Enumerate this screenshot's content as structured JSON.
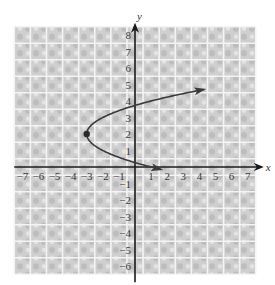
{
  "chart_data": {
    "type": "line",
    "title": "",
    "xlabel": "x",
    "ylabel": "y",
    "xlim": [
      -7.5,
      7.5
    ],
    "ylim": [
      -6.5,
      8.5
    ],
    "grid": true,
    "x_ticks": [
      -7,
      -6,
      -5,
      -4,
      -3,
      -2,
      -1,
      1,
      2,
      3,
      4,
      5,
      6,
      7
    ],
    "y_ticks": [
      -6,
      -5,
      -4,
      -3,
      -2,
      -1,
      1,
      2,
      3,
      4,
      5,
      6,
      7,
      8
    ],
    "x_tick_labels": [
      "−7",
      "−6",
      "−5",
      "−4",
      "−3",
      "−2",
      "−1",
      "1",
      "2",
      "3",
      "4",
      "5",
      "6",
      "7"
    ],
    "y_tick_labels": [
      "−6",
      "−5",
      "−4",
      "−3",
      "−2",
      "−1",
      "1",
      "2",
      "3",
      "4",
      "5",
      "6",
      "7",
      "8"
    ],
    "series": [
      {
        "name": "parabola x = (y − 2)² − 3",
        "equation": "x = (y - 2)^2 - 3",
        "y_range": [
          -0.15,
          4.7
        ],
        "vertex": {
          "x": -3,
          "y": 2
        },
        "arrows": "both-ends",
        "color": "#3a3a3a"
      }
    ],
    "points": [
      {
        "label": "vertex",
        "x": -3,
        "y": 2
      }
    ]
  },
  "colors": {
    "grid_fill": "#d2d2d2",
    "grid_line": "#f4f4f4",
    "axis": "#1a1a1a",
    "curve": "#3a3a3a"
  }
}
